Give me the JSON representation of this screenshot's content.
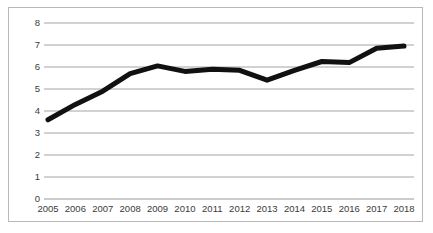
{
  "chart_data": {
    "type": "line",
    "title": "",
    "xlabel": "",
    "ylabel": "",
    "categories": [
      "2005",
      "2006",
      "2007",
      "2008",
      "2009",
      "2010",
      "2011",
      "2012",
      "2013",
      "2014",
      "2015",
      "2016",
      "2017",
      "2018"
    ],
    "values": [
      3.6,
      4.3,
      4.9,
      5.7,
      6.05,
      5.8,
      5.9,
      5.85,
      5.4,
      5.85,
      6.25,
      6.2,
      6.85,
      6.95
    ],
    "series": [
      {
        "name": "series-1",
        "values": [
          3.6,
          4.3,
          4.9,
          5.7,
          6.05,
          5.8,
          5.9,
          5.85,
          5.4,
          5.85,
          6.25,
          6.2,
          6.85,
          6.95
        ]
      }
    ],
    "ylim": [
      0,
      8
    ],
    "yticks": [
      0,
      1,
      2,
      3,
      4,
      5,
      6,
      7,
      8
    ],
    "ytick_labels": [
      "0",
      "1",
      "2",
      "3",
      "4",
      "5",
      "6",
      "7",
      "8"
    ],
    "xtick_labels": [
      "2005",
      "2006",
      "2007",
      "2008",
      "2009",
      "2010",
      "2011",
      "2012",
      "2013",
      "2014",
      "2015",
      "2016",
      "2017",
      "2018"
    ],
    "grid": "horizontal",
    "legend": "none",
    "line_color": "#111111",
    "grid_color": "#9a9a9a",
    "border_color": "#b8b8b8",
    "tick_label_color": "#3a3a3a",
    "line_width": 5
  }
}
